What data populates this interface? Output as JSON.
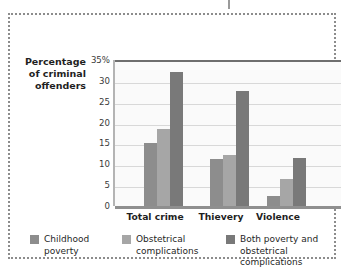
{
  "chart_data": {
    "type": "bar",
    "title": "",
    "xlabel": "",
    "ylabel": "Percentage\nof criminal\noffenders",
    "ylim": [
      0,
      35
    ],
    "yticks": [
      {
        "value": 35,
        "label": "35%"
      },
      {
        "value": 30,
        "label": "30"
      },
      {
        "value": 25,
        "label": "25"
      },
      {
        "value": 20,
        "label": "20"
      },
      {
        "value": 15,
        "label": "15"
      },
      {
        "value": 10,
        "label": "10"
      },
      {
        "value": 5,
        "label": "5"
      },
      {
        "value": 0,
        "label": "0"
      }
    ],
    "grid": true,
    "legend_position": "bottom",
    "categories": [
      "Total crime",
      "Thievery",
      "Violence"
    ],
    "series": [
      {
        "name": "Childhood\npoverty",
        "color": "#8d8d8d",
        "values": [
          15.5,
          11.7,
          3.0
        ]
      },
      {
        "name": "Obstetrical\ncomplications",
        "color": "#a6a6a6",
        "values": [
          19.0,
          12.8,
          7.0
        ]
      },
      {
        "name": "Both poverty and\nobstetrical complications",
        "color": "#797979",
        "values": [
          32.5,
          28.0,
          12.0
        ]
      }
    ]
  }
}
